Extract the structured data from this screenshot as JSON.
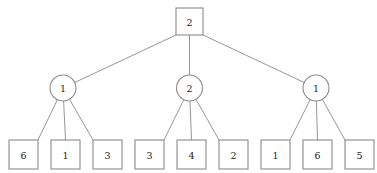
{
  "diagram": {
    "type": "tree",
    "background_color": "#ffffff",
    "stroke_color": "#8a8a8a",
    "text_color": "#1a1a1a",
    "levels": 3
  },
  "root": {
    "label": "2",
    "shape": "square",
    "cx": 189.5,
    "cy": 21.5,
    "size": 27
  },
  "branches": [
    {
      "label": "1",
      "shape": "circle",
      "cx": 63,
      "cy": 88,
      "r": 13,
      "leaves": [
        {
          "label": "6",
          "cx": 23.5,
          "cy": 154.5
        },
        {
          "label": "1",
          "cx": 65.5,
          "cy": 154.5
        },
        {
          "label": "3",
          "cx": 107.5,
          "cy": 154.5
        }
      ]
    },
    {
      "label": "2",
      "shape": "circle",
      "cx": 189.5,
      "cy": 88,
      "r": 13,
      "leaves": [
        {
          "label": "3",
          "cx": 149.5,
          "cy": 154.5
        },
        {
          "label": "4",
          "cx": 191.5,
          "cy": 154.5
        },
        {
          "label": "2",
          "cx": 233.5,
          "cy": 154.5
        }
      ]
    },
    {
      "label": "1",
      "shape": "circle",
      "cx": 316,
      "cy": 88,
      "r": 13,
      "leaves": [
        {
          "label": "1",
          "cx": 275.5,
          "cy": 154.5
        },
        {
          "label": "6",
          "cx": 317.5,
          "cy": 154.5
        },
        {
          "label": "5",
          "cx": 359.5,
          "cy": 154.5
        }
      ]
    }
  ],
  "leaf_box": {
    "size": 29
  },
  "chart_data": {
    "type": "table",
    "levels": [
      {
        "level": 0,
        "shape": "square",
        "values": [
          "2"
        ]
      },
      {
        "level": 1,
        "shape": "circle",
        "values": [
          "1",
          "2",
          "1"
        ]
      },
      {
        "level": 2,
        "shape": "square",
        "values": [
          "6",
          "1",
          "3",
          "3",
          "4",
          "2",
          "1",
          "6",
          "5"
        ]
      }
    ]
  }
}
